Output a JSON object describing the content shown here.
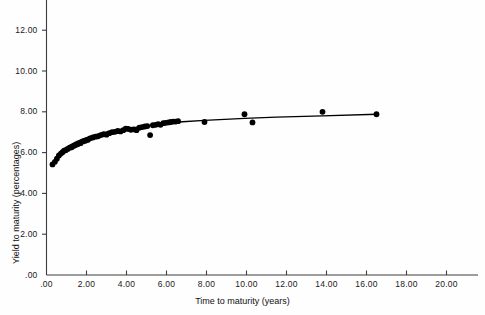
{
  "chart_data": {
    "type": "scatter",
    "title": "",
    "xlabel": "Time to maturity (years)",
    "ylabel": "Yield to maturity (percentages)",
    "xlim": [
      0.0,
      21.6
    ],
    "ylim": [
      0.0,
      13.0
    ],
    "xticks": [
      0.0,
      2.0,
      4.0,
      6.0,
      8.0,
      10.0,
      12.0,
      14.0,
      16.0,
      18.0,
      20.0
    ],
    "xtick_labels": [
      ".00",
      "2.00",
      "4.00",
      "6.00",
      "8.00",
      "10.00",
      "12.00",
      "14.00",
      "16.00",
      "18.00",
      "20.00"
    ],
    "yticks": [
      0.0,
      2.0,
      4.0,
      6.0,
      8.0,
      10.0,
      12.0
    ],
    "ytick_labels": [
      ".00",
      "2.00",
      "4.00",
      "6.00",
      "8.00",
      "10.00",
      "12.00"
    ],
    "grid": false,
    "legend": null,
    "marker_color": "#000000",
    "line_color": "#000000",
    "axis_color": "#3c3c3c",
    "series": [
      {
        "name": "Observed bond yields",
        "type": "scatter",
        "marker": "filled-circle",
        "points": [
          [
            0.3,
            5.42
          ],
          [
            0.42,
            5.55
          ],
          [
            0.52,
            5.7
          ],
          [
            0.62,
            5.86
          ],
          [
            0.72,
            5.95
          ],
          [
            0.8,
            6.02
          ],
          [
            0.88,
            6.09
          ],
          [
            0.96,
            6.12
          ],
          [
            1.06,
            6.18
          ],
          [
            1.16,
            6.24
          ],
          [
            1.26,
            6.26
          ],
          [
            1.38,
            6.33
          ],
          [
            1.48,
            6.38
          ],
          [
            1.58,
            6.42
          ],
          [
            1.7,
            6.46
          ],
          [
            1.82,
            6.55
          ],
          [
            1.94,
            6.58
          ],
          [
            2.06,
            6.62
          ],
          [
            2.18,
            6.7
          ],
          [
            2.32,
            6.74
          ],
          [
            2.46,
            6.78
          ],
          [
            2.58,
            6.8
          ],
          [
            2.72,
            6.86
          ],
          [
            2.86,
            6.9
          ],
          [
            3.0,
            6.88
          ],
          [
            3.14,
            6.95
          ],
          [
            3.28,
            7.0
          ],
          [
            3.42,
            7.02
          ],
          [
            3.56,
            7.06
          ],
          [
            3.7,
            7.04
          ],
          [
            3.84,
            7.1
          ],
          [
            3.96,
            7.18
          ],
          [
            4.08,
            7.16
          ],
          [
            4.22,
            7.12
          ],
          [
            4.36,
            7.14
          ],
          [
            4.5,
            7.1
          ],
          [
            4.64,
            7.22
          ],
          [
            4.78,
            7.25
          ],
          [
            4.92,
            7.28
          ],
          [
            5.04,
            7.3
          ],
          [
            5.18,
            6.86
          ],
          [
            5.32,
            7.34
          ],
          [
            5.46,
            7.36
          ],
          [
            5.58,
            7.4
          ],
          [
            5.7,
            7.36
          ],
          [
            5.84,
            7.44
          ],
          [
            5.96,
            7.46
          ],
          [
            6.1,
            7.48
          ],
          [
            6.22,
            7.5
          ],
          [
            6.34,
            7.52
          ],
          [
            6.46,
            7.52
          ],
          [
            6.58,
            7.54
          ],
          [
            7.9,
            7.5
          ],
          [
            9.9,
            7.88
          ],
          [
            10.3,
            7.48
          ],
          [
            13.8,
            8.0
          ],
          [
            16.5,
            7.88
          ]
        ]
      },
      {
        "name": "Fitted yield curve",
        "type": "line",
        "points": [
          [
            0.3,
            5.44
          ],
          [
            0.6,
            5.9
          ],
          [
            0.9,
            6.18
          ],
          [
            1.2,
            6.38
          ],
          [
            1.5,
            6.54
          ],
          [
            1.9,
            6.7
          ],
          [
            2.3,
            6.83
          ],
          [
            2.8,
            6.96
          ],
          [
            3.3,
            7.06
          ],
          [
            3.8,
            7.14
          ],
          [
            4.3,
            7.21
          ],
          [
            4.8,
            7.28
          ],
          [
            5.3,
            7.34
          ],
          [
            5.8,
            7.4
          ],
          [
            6.3,
            7.46
          ],
          [
            6.8,
            7.51
          ],
          [
            7.9,
            7.58
          ],
          [
            9.9,
            7.68
          ],
          [
            11.5,
            7.74
          ],
          [
            13.8,
            7.8
          ],
          [
            16.5,
            7.88
          ]
        ]
      }
    ]
  },
  "axes": {
    "x_axis_name": "x-axis",
    "y_axis_name": "y-axis"
  }
}
